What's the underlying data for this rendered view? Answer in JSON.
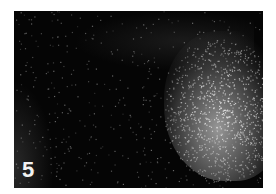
{
  "figure": {
    "panel_label": "5",
    "background_color": "#050505",
    "signal_color": "#c8c8c8"
  }
}
